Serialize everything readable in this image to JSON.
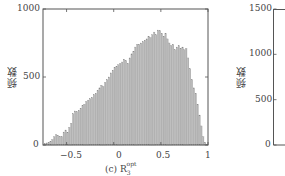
{
  "chart_data": [
    {
      "type": "bar",
      "title": "",
      "caption": "(c) R_3^opt",
      "caption_prefix": "(c) R",
      "caption_sub": "3",
      "caption_sup": "opt",
      "xlabel": "",
      "ylabel": "频数",
      "xlim": [
        -0.75,
        1.0
      ],
      "ylim": [
        0,
        1000
      ],
      "xticks": [
        -0.5,
        0,
        0.5,
        1
      ],
      "xtick_labels": [
        "−0.5",
        "0",
        "0.5",
        "1"
      ],
      "yticks": [
        0,
        500,
        1000
      ],
      "ytick_labels": [
        "0",
        "500",
        "1000"
      ],
      "grid": false,
      "bar_color": "#b8b8b8",
      "x": [
        -0.73,
        -0.71,
        -0.69,
        -0.67,
        -0.65,
        -0.63,
        -0.61,
        -0.59,
        -0.57,
        -0.55,
        -0.53,
        -0.51,
        -0.49,
        -0.47,
        -0.45,
        -0.43,
        -0.41,
        -0.39,
        -0.37,
        -0.35,
        -0.33,
        -0.31,
        -0.29,
        -0.27,
        -0.25,
        -0.23,
        -0.21,
        -0.19,
        -0.17,
        -0.15,
        -0.13,
        -0.11,
        -0.09,
        -0.07,
        -0.05,
        -0.03,
        -0.01,
        0.01,
        0.03,
        0.05,
        0.07,
        0.09,
        0.11,
        0.13,
        0.15,
        0.17,
        0.19,
        0.21,
        0.23,
        0.25,
        0.27,
        0.29,
        0.31,
        0.33,
        0.35,
        0.37,
        0.39,
        0.41,
        0.43,
        0.45,
        0.47,
        0.49,
        0.51,
        0.53,
        0.55,
        0.57,
        0.59,
        0.61,
        0.63,
        0.65,
        0.67,
        0.69,
        0.71,
        0.73,
        0.75,
        0.77,
        0.79,
        0.81,
        0.83,
        0.85,
        0.87,
        0.89,
        0.91,
        0.93,
        0.95,
        0.97,
        0.99
      ],
      "values": [
        10,
        15,
        20,
        25,
        40,
        60,
        75,
        70,
        65,
        60,
        95,
        110,
        90,
        130,
        160,
        230,
        250,
        245,
        255,
        270,
        290,
        300,
        320,
        330,
        340,
        350,
        370,
        380,
        400,
        420,
        440,
        430,
        460,
        480,
        500,
        530,
        550,
        570,
        575,
        590,
        600,
        610,
        630,
        620,
        600,
        640,
        670,
        690,
        720,
        740,
        740,
        750,
        760,
        770,
        780,
        800,
        790,
        810,
        830,
        810,
        845,
        840,
        820,
        800,
        820,
        780,
        750,
        730,
        740,
        700,
        720,
        730,
        710,
        720,
        700,
        710,
        640,
        560,
        480,
        420,
        380,
        300,
        220,
        140,
        60,
        20,
        5
      ]
    },
    {
      "type": "bar",
      "title": "",
      "xlabel": "",
      "ylabel": "频数",
      "ylim": [
        0,
        1500
      ],
      "yticks": [
        0,
        500,
        1000,
        1500
      ],
      "ytick_labels": [
        "0",
        "500",
        "1000",
        "1500"
      ],
      "partial": true
    }
  ]
}
